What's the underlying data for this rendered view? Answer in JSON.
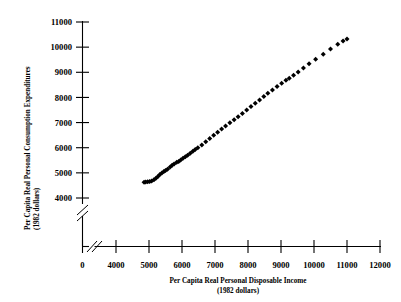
{
  "chart_data": {
    "type": "scatter",
    "title": "",
    "xlabel": "Per Capita Real Personal Disposable Income",
    "xlabel_units": "(1982 dollars)",
    "ylabel": "Per Capita Real Personal Consumption Expenditures",
    "ylabel_units": "(1982 dollars)",
    "xlim": [
      4000,
      12000
    ],
    "ylim": [
      4000,
      11000
    ],
    "xticks": [
      0,
      4000,
      5000,
      6000,
      7000,
      8000,
      9000,
      10000,
      11000,
      12000
    ],
    "yticks": [
      4000,
      5000,
      6000,
      7000,
      8000,
      9000,
      10000,
      11000
    ],
    "xtick_labels": [
      "0",
      "4000",
      "5000",
      "6000",
      "7000",
      "8000",
      "9000",
      "10000",
      "11000",
      "12000"
    ],
    "ytick_labels": [
      "4000",
      "5000",
      "6000",
      "7000",
      "8000",
      "9000",
      "10000",
      "11000"
    ],
    "grid": false,
    "legend": null,
    "axis_break_x": true,
    "axis_break_y": true,
    "marker": "filled-diamond",
    "marker_color": "#000000",
    "series": [
      {
        "name": "Consumption vs Disposable Income",
        "points": [
          [
            4850,
            4630
          ],
          [
            4900,
            4640
          ],
          [
            4960,
            4650
          ],
          [
            5020,
            4660
          ],
          [
            5080,
            4680
          ],
          [
            5150,
            4730
          ],
          [
            5210,
            4790
          ],
          [
            5270,
            4860
          ],
          [
            5330,
            4930
          ],
          [
            5390,
            4990
          ],
          [
            5450,
            5050
          ],
          [
            5500,
            5090
          ],
          [
            5560,
            5140
          ],
          [
            5640,
            5230
          ],
          [
            5700,
            5300
          ],
          [
            5760,
            5350
          ],
          [
            5840,
            5420
          ],
          [
            5900,
            5450
          ],
          [
            5960,
            5510
          ],
          [
            6030,
            5580
          ],
          [
            6100,
            5640
          ],
          [
            6170,
            5700
          ],
          [
            6250,
            5780
          ],
          [
            6330,
            5860
          ],
          [
            6400,
            5930
          ],
          [
            6480,
            6000
          ],
          [
            6600,
            6110
          ],
          [
            6720,
            6240
          ],
          [
            6840,
            6370
          ],
          [
            6960,
            6500
          ],
          [
            7080,
            6620
          ],
          [
            7200,
            6740
          ],
          [
            7320,
            6860
          ],
          [
            7450,
            6990
          ],
          [
            7580,
            7110
          ],
          [
            7700,
            7230
          ],
          [
            7830,
            7360
          ],
          [
            7960,
            7500
          ],
          [
            8090,
            7640
          ],
          [
            8220,
            7770
          ],
          [
            8350,
            7900
          ],
          [
            8480,
            8040
          ],
          [
            8600,
            8170
          ],
          [
            8740,
            8300
          ],
          [
            8880,
            8430
          ],
          [
            9020,
            8560
          ],
          [
            9150,
            8680
          ],
          [
            9250,
            8760
          ],
          [
            9380,
            8880
          ],
          [
            9520,
            9010
          ],
          [
            9680,
            9170
          ],
          [
            9850,
            9340
          ],
          [
            10050,
            9520
          ],
          [
            10280,
            9720
          ],
          [
            10500,
            9930
          ],
          [
            10720,
            10120
          ],
          [
            10880,
            10240
          ],
          [
            11000,
            10320
          ]
        ]
      }
    ]
  },
  "axes": {
    "x_axis_name": "x-axis",
    "y_axis_name": "y-axis"
  }
}
